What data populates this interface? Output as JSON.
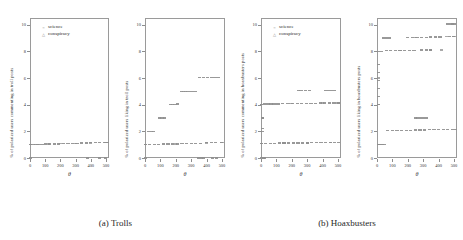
{
  "figure": {
    "xlabel": "θ",
    "legend": [
      {
        "label": "science",
        "marker": "circle"
      },
      {
        "label": "conspiracy",
        "marker": "triangle"
      }
    ],
    "yticks": [
      "0",
      "2",
      "4",
      "6",
      "8",
      "10"
    ],
    "xticks": [
      "0",
      "100",
      "200",
      "300",
      "400",
      "500"
    ]
  },
  "groups": [
    {
      "caption": "(a) Trolls"
    },
    {
      "caption": "(b) Hoaxbusters"
    }
  ],
  "chart_data": [
    {
      "type": "scatter",
      "panel_index": 0,
      "group": "(a) Trolls",
      "title": "",
      "xlabel": "θ",
      "ylabel": "% of polarized users commenting in troll posts",
      "xlim": [
        0,
        520
      ],
      "ylim": [
        0,
        10.5
      ],
      "xticks": [
        0,
        100,
        200,
        300,
        400,
        500
      ],
      "yticks": [
        0,
        2,
        4,
        6,
        8,
        10
      ],
      "grid": false,
      "legend_position": "top-left",
      "series": [
        {
          "name": "science",
          "marker": "circle",
          "points": [
            [
              5,
              1.0
            ],
            [
              20,
              1.0
            ],
            [
              40,
              1.0
            ],
            [
              60,
              1.0
            ],
            [
              80,
              1.0
            ],
            [
              100,
              1.05
            ],
            [
              130,
              1.05
            ],
            [
              160,
              1.05
            ],
            [
              190,
              1.05
            ],
            [
              220,
              1.1
            ],
            [
              250,
              1.1
            ],
            [
              280,
              1.1
            ],
            [
              310,
              1.1
            ],
            [
              340,
              1.12
            ],
            [
              370,
              1.12
            ],
            [
              400,
              1.15
            ],
            [
              430,
              1.15
            ],
            [
              460,
              1.15
            ],
            [
              490,
              1.18
            ],
            [
              510,
              1.18
            ],
            [
              5,
              0.0
            ],
            [
              380,
              0.0
            ],
            [
              455,
              0.0
            ],
            [
              495,
              0.0
            ]
          ]
        },
        {
          "name": "conspiracy",
          "marker": "triangle",
          "points": [
            [
              5,
              1.0
            ],
            [
              50,
              1.02
            ],
            [
              120,
              1.05
            ],
            [
              200,
              1.08
            ],
            [
              300,
              1.1
            ],
            [
              400,
              1.14
            ],
            [
              500,
              1.18
            ]
          ]
        }
      ]
    },
    {
      "type": "scatter",
      "panel_index": 1,
      "group": "(a) Trolls",
      "title": "",
      "xlabel": "θ",
      "ylabel": "% of polarized users liking in troll posts",
      "xlim": [
        0,
        520
      ],
      "ylim": [
        0,
        10.5
      ],
      "xticks": [
        0,
        100,
        200,
        300,
        400,
        500
      ],
      "yticks": [
        0,
        2,
        4,
        6,
        8,
        10
      ],
      "grid": false,
      "legend_position": "none",
      "series": [
        {
          "name": "science",
          "marker": "circle",
          "points": [
            [
              5,
              1.0
            ],
            [
              30,
              1.0
            ],
            [
              60,
              1.0
            ],
            [
              90,
              1.0
            ],
            [
              120,
              1.05
            ],
            [
              150,
              1.05
            ],
            [
              180,
              1.05
            ],
            [
              210,
              1.05
            ],
            [
              240,
              1.08
            ],
            [
              270,
              1.08
            ],
            [
              300,
              1.08
            ],
            [
              330,
              1.1
            ],
            [
              360,
              1.1
            ],
            [
              400,
              1.15
            ],
            [
              430,
              1.15
            ],
            [
              460,
              1.15
            ],
            [
              495,
              1.15
            ],
            [
              25,
              2.0
            ],
            [
              40,
              2.0
            ],
            [
              55,
              2.0
            ],
            [
              95,
              3.0
            ],
            [
              110,
              3.0
            ],
            [
              125,
              3.0
            ],
            [
              165,
              4.0
            ],
            [
              180,
              4.0
            ],
            [
              195,
              4.0
            ],
            [
              210,
              4.05
            ],
            [
              235,
              5.0
            ],
            [
              250,
              5.0
            ],
            [
              265,
              5.0
            ],
            [
              280,
              5.0
            ],
            [
              300,
              5.0
            ],
            [
              325,
              5.0
            ],
            [
              355,
              6.05
            ],
            [
              380,
              6.05
            ],
            [
              405,
              6.05
            ],
            [
              430,
              6.05
            ],
            [
              455,
              6.05
            ],
            [
              480,
              6.05
            ],
            [
              5,
              0.0
            ],
            [
              350,
              0.0
            ],
            [
              365,
              0.0
            ],
            [
              380,
              0.0
            ],
            [
              440,
              0.0
            ],
            [
              465,
              0.0
            ]
          ]
        },
        {
          "name": "conspiracy",
          "marker": "triangle",
          "points": [
            [
              5,
              1.0
            ],
            [
              200,
              1.05
            ],
            [
              400,
              1.12
            ],
            [
              500,
              1.15
            ]
          ]
        }
      ]
    },
    {
      "type": "scatter",
      "panel_index": 2,
      "group": "(b) Hoaxbusters",
      "title": "",
      "xlabel": "θ",
      "ylabel": "% of polarized users commenting in hoaxbusters posts",
      "xlim": [
        0,
        520
      ],
      "ylim": [
        0,
        10.5
      ],
      "xticks": [
        0,
        100,
        200,
        300,
        400,
        500
      ],
      "yticks": [
        0,
        2,
        4,
        6,
        8,
        10
      ],
      "grid": false,
      "legend_position": "top-left",
      "series": [
        {
          "name": "science",
          "marker": "circle",
          "points": [
            [
              5,
              1.1
            ],
            [
              30,
              1.1
            ],
            [
              60,
              1.1
            ],
            [
              90,
              1.1
            ],
            [
              120,
              1.12
            ],
            [
              150,
              1.12
            ],
            [
              180,
              1.12
            ],
            [
              210,
              1.12
            ],
            [
              240,
              1.14
            ],
            [
              270,
              1.14
            ],
            [
              300,
              1.14
            ],
            [
              330,
              1.15
            ],
            [
              360,
              1.15
            ],
            [
              390,
              1.16
            ],
            [
              420,
              1.16
            ],
            [
              450,
              1.18
            ],
            [
              480,
              1.18
            ],
            [
              505,
              1.18
            ],
            [
              8,
              2.0
            ],
            [
              10,
              2.2
            ],
            [
              8,
              3.0
            ],
            [
              12,
              3.0
            ],
            [
              5,
              4.0
            ],
            [
              25,
              4.05
            ],
            [
              45,
              4.05
            ],
            [
              65,
              4.05
            ],
            [
              85,
              4.05
            ],
            [
              110,
              4.05
            ],
            [
              140,
              4.08
            ],
            [
              175,
              4.08
            ],
            [
              205,
              4.08
            ],
            [
              235,
              4.08
            ],
            [
              265,
              4.1
            ],
            [
              295,
              4.1
            ],
            [
              325,
              4.1
            ],
            [
              355,
              4.1
            ],
            [
              385,
              4.12
            ],
            [
              415,
              4.12
            ],
            [
              445,
              4.12
            ],
            [
              475,
              4.12
            ],
            [
              505,
              4.12
            ],
            [
              245,
              5.05
            ],
            [
              260,
              5.05
            ],
            [
              290,
              5.05
            ],
            [
              315,
              5.05
            ],
            [
              420,
              5.08
            ],
            [
              440,
              5.08
            ],
            [
              460,
              5.08
            ],
            [
              480,
              5.08
            ],
            [
              5,
              0.0
            ],
            [
              15,
              0.0
            ],
            [
              25,
              0.0
            ]
          ]
        },
        {
          "name": "conspiracy",
          "marker": "triangle",
          "points": [
            [
              5,
              1.1
            ],
            [
              150,
              1.12
            ],
            [
              300,
              1.14
            ],
            [
              450,
              1.18
            ],
            [
              5,
              4.0
            ],
            [
              200,
              4.08
            ],
            [
              400,
              4.12
            ],
            [
              500,
              4.12
            ]
          ]
        }
      ]
    },
    {
      "type": "scatter",
      "panel_index": 3,
      "group": "(b) Hoaxbusters",
      "title": "",
      "xlabel": "θ",
      "ylabel": "% of polarized users liking in hoaxbusters posts",
      "xlim": [
        0,
        520
      ],
      "ylim": [
        0,
        10.5
      ],
      "xticks": [
        0,
        100,
        200,
        300,
        400,
        500
      ],
      "yticks": [
        0,
        2,
        4,
        6,
        8,
        10
      ],
      "grid": false,
      "legend_position": "none",
      "series": [
        {
          "name": "science",
          "marker": "circle",
          "points": [
            [
              8,
              1.0
            ],
            [
              18,
              1.0
            ],
            [
              28,
              1.0
            ],
            [
              38,
              1.0
            ],
            [
              50,
              1.0
            ],
            [
              70,
              2.05
            ],
            [
              100,
              2.05
            ],
            [
              130,
              2.05
            ],
            [
              160,
              2.08
            ],
            [
              190,
              2.08
            ],
            [
              220,
              2.08
            ],
            [
              250,
              2.1
            ],
            [
              280,
              2.1
            ],
            [
              310,
              2.1
            ],
            [
              340,
              2.12
            ],
            [
              370,
              2.12
            ],
            [
              400,
              2.12
            ],
            [
              430,
              2.14
            ],
            [
              460,
              2.14
            ],
            [
              490,
              2.15
            ],
            [
              510,
              2.15
            ],
            [
              250,
              3.0
            ],
            [
              265,
              3.0
            ],
            [
              285,
              3.0
            ],
            [
              300,
              3.0
            ],
            [
              320,
              3.0
            ],
            [
              12,
              4.0
            ],
            [
              12,
              4.6
            ],
            [
              12,
              5.2
            ],
            [
              12,
              5.8
            ],
            [
              12,
              6.4
            ],
            [
              10,
              7.0
            ],
            [
              8,
              8.0
            ],
            [
              30,
              8.0
            ],
            [
              60,
              8.05
            ],
            [
              90,
              8.05
            ],
            [
              120,
              8.05
            ],
            [
              150,
              8.05
            ],
            [
              180,
              8.08
            ],
            [
              210,
              8.08
            ],
            [
              240,
              8.08
            ],
            [
              290,
              8.1
            ],
            [
              320,
              8.1
            ],
            [
              350,
              8.1
            ],
            [
              40,
              9.0
            ],
            [
              60,
              9.0
            ],
            [
              80,
              9.0
            ],
            [
              200,
              9.05
            ],
            [
              230,
              9.05
            ],
            [
              260,
              9.05
            ],
            [
              290,
              9.05
            ],
            [
              320,
              9.05
            ],
            [
              350,
              9.08
            ],
            [
              380,
              9.08
            ],
            [
              410,
              9.08
            ],
            [
              470,
              9.1
            ],
            [
              495,
              9.1
            ],
            [
              460,
              10.05
            ],
            [
              480,
              10.05
            ],
            [
              500,
              10.05
            ]
          ]
        },
        {
          "name": "conspiracy",
          "marker": "triangle",
          "points": [
            [
              10,
              1.0
            ],
            [
              12,
              4.0
            ],
            [
              12,
              6.0
            ],
            [
              150,
              8.05
            ],
            [
              350,
              8.1
            ],
            [
              420,
              8.1
            ],
            [
              250,
              9.05
            ],
            [
              450,
              9.1
            ],
            [
              500,
              9.1
            ],
            [
              490,
              10.05
            ]
          ]
        }
      ]
    }
  ]
}
